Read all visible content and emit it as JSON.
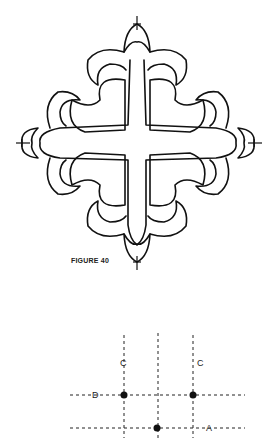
{
  "figure": {
    "caption": "FIGURE 40",
    "motif": "quatrefoil cross with fleur-de-lis terminals"
  },
  "grid_diagram": {
    "labels": {
      "c_left": "C",
      "c_right": "C",
      "d": "D",
      "a": "A"
    },
    "vertical_lines_x": [
      124,
      158,
      193
    ],
    "horizontal_lines_y": [
      395,
      428
    ],
    "points": [
      {
        "x": 124,
        "y": 395
      },
      {
        "x": 193,
        "y": 395
      },
      {
        "x": 157,
        "y": 428
      }
    ]
  }
}
